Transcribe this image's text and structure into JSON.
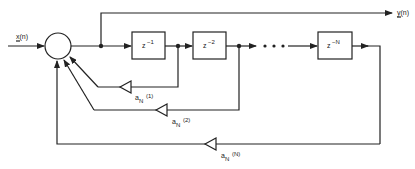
{
  "diagram": {
    "type": "block-diagram",
    "title": "",
    "input": {
      "label": "x(n)"
    },
    "output": {
      "label": "y(n)"
    },
    "summing_junction": {
      "symbol": "circle"
    },
    "delays": [
      {
        "base": "z",
        "exp": "−1"
      },
      {
        "base": "z",
        "exp": "−2"
      },
      {
        "base": "z",
        "exp": "−N"
      }
    ],
    "ellipsis": "• • •",
    "gains": [
      {
        "base": "a",
        "sub": "N",
        "arg": "(1)"
      },
      {
        "base": "a",
        "sub": "N",
        "arg": "(2)"
      },
      {
        "base": "a",
        "sub": "N",
        "arg": "(N)"
      }
    ],
    "colors": {
      "line": "#222222",
      "background": "#ffffff"
    }
  }
}
